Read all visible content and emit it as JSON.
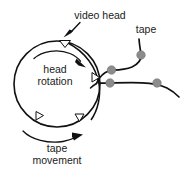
{
  "figure": {
    "background_color": "#ffffff",
    "width": 185,
    "height": 169,
    "labels": {
      "video_head": "video head",
      "tape": "tape",
      "head_rotation_line1": "head",
      "head_rotation_line2": "rotation",
      "tape_movement_line1": "tape",
      "tape_movement_line2": "movement"
    },
    "colors": {
      "ink": "#111111",
      "text": "#1a1a1a",
      "roller_fill": "#8c8c8c",
      "roller_stroke": "#6f6f6f",
      "head_fill": "#ffffff"
    },
    "drum": {
      "center_x": 57,
      "center_y": 84,
      "radius": 43,
      "stroke_width": 1.6
    },
    "heads": [
      {
        "name": "head-top",
        "angle_deg": -75,
        "label": "video head marker"
      },
      {
        "name": "head-right",
        "angle_deg": 8,
        "label": "head marker right"
      },
      {
        "name": "head-bottom-right",
        "angle_deg": 55,
        "label": "head marker bottom right"
      },
      {
        "name": "head-bottom-left",
        "angle_deg": 122,
        "label": "head marker bottom left"
      }
    ],
    "rollers": [
      {
        "name": "roller-drum-exit",
        "cx": 111,
        "cy": 70,
        "r": 4.2
      },
      {
        "name": "roller-lower-left",
        "cx": 111,
        "cy": 83,
        "r": 4.2
      },
      {
        "name": "roller-upper-right",
        "cx": 141,
        "cy": 55,
        "r": 4.2
      },
      {
        "name": "roller-lower-right",
        "cx": 157,
        "cy": 83,
        "r": 4.2
      }
    ],
    "annotations": {
      "video_head_pointer": "arrow pointing down-left to top head",
      "head_rotation_arrow": "clockwise curved arrow inside drum",
      "tape_movement_arrow": "curved arrow below drum pointing right"
    }
  }
}
